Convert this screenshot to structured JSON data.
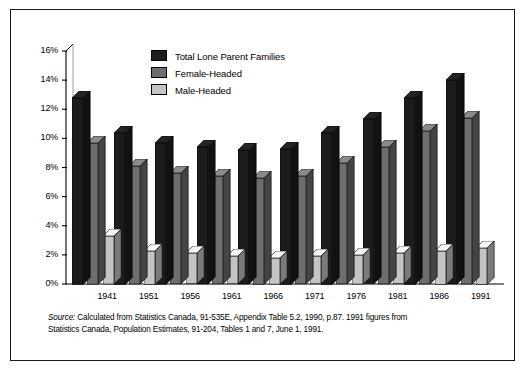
{
  "chart_data": {
    "type": "bar",
    "title": "",
    "xlabel": "",
    "ylabel": "",
    "ylim": [
      0,
      16
    ],
    "ytick_labels": [
      "0%",
      "2%",
      "4%",
      "6%",
      "8%",
      "10%",
      "12%",
      "14%",
      "16%"
    ],
    "ytick_values": [
      0,
      2,
      4,
      6,
      8,
      10,
      12,
      14,
      16
    ],
    "grid": false,
    "legend_position": "top-center",
    "categories": [
      "1941",
      "1951",
      "1956",
      "1961",
      "1966",
      "1971",
      "1976",
      "1981",
      "1986",
      "1991"
    ],
    "series": [
      {
        "name": "Total Lone Parent Families",
        "color": "#1c1c1c",
        "values": [
          12.8,
          10.4,
          9.7,
          9.4,
          9.2,
          9.3,
          10.4,
          11.3,
          12.8,
          14.0
        ]
      },
      {
        "name": "Female-Headed",
        "color": "#6e6e6e",
        "values": [
          9.7,
          8.1,
          7.6,
          7.4,
          7.3,
          7.4,
          8.3,
          9.4,
          10.5,
          11.4
        ]
      },
      {
        "name": "Male-Headed",
        "color": "#c4c4c4",
        "values": [
          3.3,
          2.3,
          2.1,
          1.9,
          1.8,
          1.9,
          2.0,
          2.1,
          2.3,
          2.5
        ]
      }
    ],
    "source_note_prefix": "Source:",
    "source_note_line1": "  Calculated from Statistics Canada, 91-535E, Appendix Table 5.2, 1990, p.87. 1991 figures from",
    "source_note_line2": "Statistics Canada, Population Estimates, 91-204, Tables 1 and 7, June 1, 1991."
  }
}
